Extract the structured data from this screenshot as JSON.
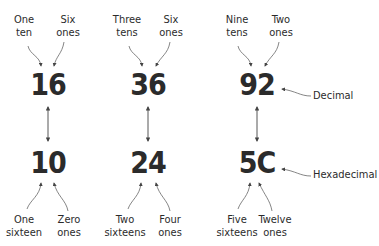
{
  "columns": [
    {
      "decimal": "16",
      "hex": "10",
      "top_left": [
        "One",
        "ten"
      ],
      "top_right": [
        "Six",
        "ones"
      ],
      "bottom_left": [
        "One",
        "sixteen"
      ],
      "bottom_right": [
        "Zero",
        "ones"
      ]
    },
    {
      "decimal": "36",
      "hex": "24",
      "top_left": [
        "Three",
        "tens"
      ],
      "top_right": [
        "Six",
        "ones"
      ],
      "bottom_left": [
        "Two",
        "sixteens"
      ],
      "bottom_right": [
        "Four",
        "ones"
      ]
    },
    {
      "decimal": "92",
      "hex": "5C",
      "top_left": [
        "Nine",
        "tens"
      ],
      "top_right": [
        "Two",
        "ones"
      ],
      "bottom_left": [
        "Five",
        "sixteens"
      ],
      "bottom_right": [
        "Twelve",
        "ones"
      ]
    }
  ],
  "row_labels": {
    "decimal": "Decimal",
    "hex": "Hexadecimal"
  },
  "colors": {
    "text": "#2b2b2b",
    "line": "#555555"
  }
}
